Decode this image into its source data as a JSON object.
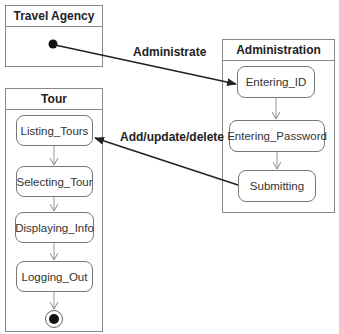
{
  "packages": {
    "travel_agency": {
      "title": "Travel Agency"
    },
    "administration": {
      "title": "Administration",
      "states": [
        "Entering_ID",
        "Entering_Password",
        "Submitting"
      ]
    },
    "tour": {
      "title": "Tour",
      "states": [
        "Listing_Tours",
        "Selecting_Tour",
        "Displaying_Info",
        "Logging_Out"
      ]
    }
  },
  "transitions": {
    "administrate": "Administrate",
    "add_update_delete": "Add/update/delete"
  }
}
